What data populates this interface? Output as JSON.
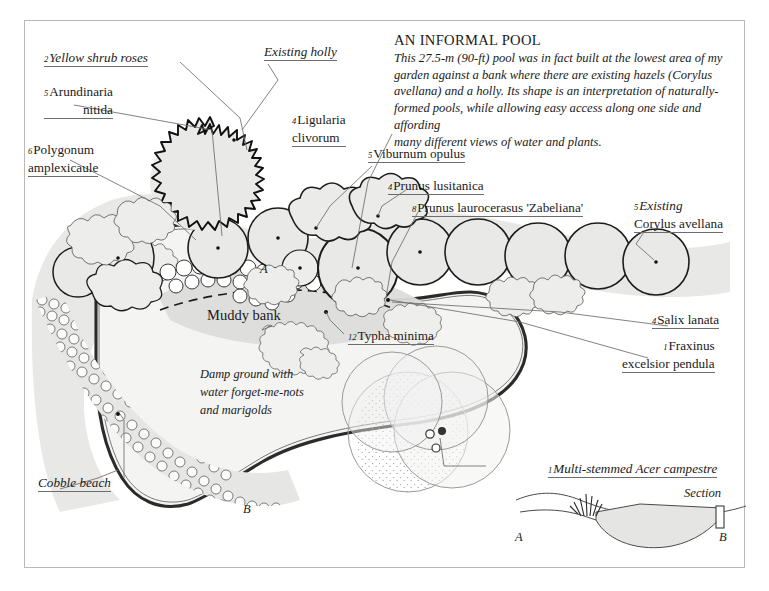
{
  "title": "AN INFORMAL POOL",
  "description": [
    "This 27.5-m (90-ft) pool was in fact built at the lowest area of my",
    "garden against a bank where there are existing hazels (Corylus",
    "avellana) and a holly. Its shape is an interpretation of naturally-",
    "formed pools, while allowing easy access along one side and affording",
    "many different views of water and plants."
  ],
  "plant_labels": [
    {
      "key": "yellow-shrub-roses",
      "qty": "2",
      "name": "Yellow shrub roses",
      "italic": true
    },
    {
      "key": "arundinaria-nitida",
      "qty": "5",
      "name": "Arundinaria",
      "name2": "nitida",
      "italic": false
    },
    {
      "key": "polygonum-amplexicaule",
      "qty": "6",
      "name": "Polygonum",
      "name2": "amplexicaule",
      "italic": false
    },
    {
      "key": "existing-holly",
      "qty": "",
      "name": "Existing holly",
      "italic": true
    },
    {
      "key": "ligularia-clivorum",
      "qty": "4",
      "name": "Ligularia",
      "name2": "clivorum",
      "italic": false
    },
    {
      "key": "viburnum-opulus",
      "qty": "5",
      "name": "Viburnum opulus",
      "italic": false
    },
    {
      "key": "prunus-lusitanica",
      "qty": "4",
      "name": "Prunus lusitanica",
      "italic": false
    },
    {
      "key": "prunus-laurocerasus",
      "qty": "8",
      "name": "Prunus laurocerasus 'Zabeliana'",
      "italic": false
    },
    {
      "key": "existing-corylus-avellana",
      "qty": "5",
      "name": "Existing",
      "name2": "Corylus avellana",
      "italic": false
    },
    {
      "key": "salix-lanata",
      "qty": "4",
      "name": "Salix lanata",
      "italic": false
    },
    {
      "key": "fraxinus-excelsior-pendula",
      "qty": "1",
      "name": "Fraxinus",
      "name2": "excelsior pendula",
      "italic": false
    },
    {
      "key": "typha-minima",
      "qty": "12",
      "name": "Typha minima",
      "italic": false
    },
    {
      "key": "acer-campestre",
      "qty": "1",
      "name": "Multi-stemmed Acer campestre",
      "italic": true
    }
  ],
  "area_labels": {
    "muddy_bank": "Muddy bank",
    "cobble_beach": "Cobble beach",
    "damp_ground": [
      "Damp ground with",
      "water forget-me-nots",
      "and marigolds"
    ]
  },
  "section": {
    "caption": "Section",
    "point_a": "A",
    "point_b": "B"
  },
  "plan_markers": {
    "point_a": "A",
    "point_b": "B"
  },
  "colors": {
    "frame": "#b9b9b9",
    "ink": "#1a1a1a",
    "fill_light": "#e8e8e6",
    "fill_mid": "#dcdcda",
    "water": "#f4f4f3",
    "leader": "#6d6d6d"
  }
}
